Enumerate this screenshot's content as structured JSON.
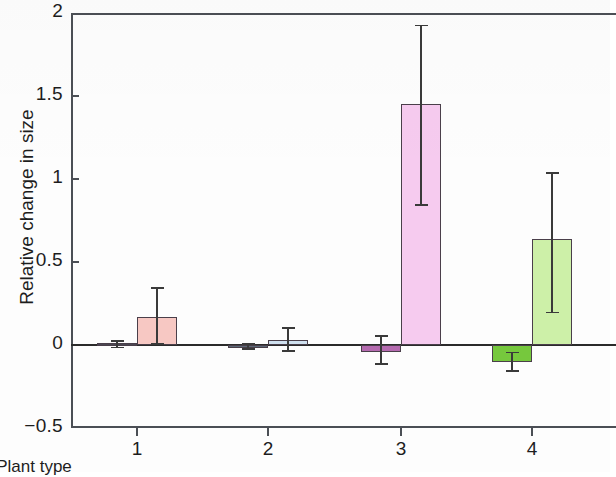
{
  "chart_data": {
    "type": "bar",
    "title": "",
    "xlabel": "Plant type",
    "ylabel": "Relative change in size",
    "categories": [
      "1",
      "2",
      "3",
      "4"
    ],
    "xtick_labels": [
      "1",
      "2",
      "3",
      "4"
    ],
    "ytick_labels": [
      "2",
      "1.5",
      "1",
      "0.5",
      "0",
      "−0.5"
    ],
    "ytick_values": [
      2,
      1.5,
      1,
      0.5,
      0,
      -0.5
    ],
    "ylim": [
      -0.5,
      2
    ],
    "xlim": [
      0.5,
      4.5
    ],
    "grid": false,
    "legend": "none",
    "series": [
      {
        "name": "control",
        "color": "#4a4752",
        "values": [
          0.01,
          -0.01,
          -0.04,
          -0.1
        ],
        "err_low": [
          -0.02,
          -0.03,
          -0.12,
          -0.16
        ],
        "err_high": [
          0.03,
          0.01,
          0.06,
          -0.04
        ]
      },
      {
        "name": "treatment",
        "colors": [
          "#f7c8c3",
          "#cfe0ef",
          "#f6cbef",
          "#cdf0a8"
        ],
        "values": [
          0.17,
          0.03,
          1.45,
          0.64
        ],
        "err_low": [
          0.0,
          -0.04,
          0.84,
          0.19
        ],
        "err_high": [
          0.35,
          0.11,
          1.93,
          1.04
        ]
      }
    ]
  },
  "axes": {
    "y_label_text": "Relative change in size",
    "x_label_text": "Plant type"
  },
  "colors": {
    "axis": "#4b4f55",
    "bar_outline": "#4a3f4a",
    "error_bar": "#3a3a3a",
    "control_fill": "#4a4752",
    "pink_fill": "#f7c8c3",
    "blue_fill": "#cfe0ef",
    "magenta_fill": "#f6cbef",
    "green_fill": "#cdf0a8",
    "dark_green_fill": "#76c83d",
    "dark_magenta_fill": "#b56bb0",
    "dark_blue_fill": "#5d6a78"
  }
}
